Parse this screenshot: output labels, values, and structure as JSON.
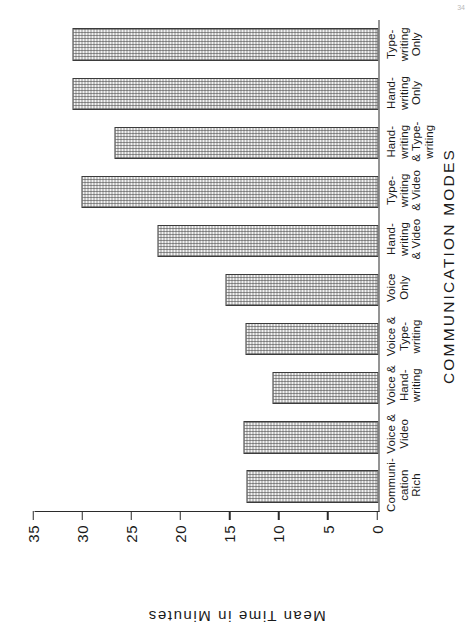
{
  "figure": {
    "corner_mark": "34",
    "orientation": "landscape-rotated"
  },
  "chart_data": {
    "type": "bar",
    "orientation": "vertical",
    "title": "",
    "xlabel": "COMMUNICATION MODES",
    "ylabel": "Mean Time in Minutes",
    "ylim": [
      0,
      35
    ],
    "yticks": [
      0,
      5,
      10,
      15,
      20,
      25,
      30,
      35
    ],
    "ytick_labels": [
      "0",
      "5",
      "10",
      "15",
      "20",
      "25",
      "30",
      "35"
    ],
    "grid": false,
    "legend": null,
    "categories": [
      "Communi-\ncation\nRich",
      "Voice &\nVideo",
      "Voice &\nHand-\nwriting",
      "Voice &\nType-\nwriting",
      "Voice\nOnly",
      "Hand-\nwriting\n& Video",
      "Type-\nwriting\n& Video",
      "Hand-\nwriting\n& Type-\nwriting",
      "Hand-\nwriting\nOnly",
      "Type-\nwriting\nOnly"
    ],
    "category_lines": [
      [
        "Communi-",
        "cation",
        "Rich"
      ],
      [
        "Voice &",
        "Video"
      ],
      [
        "Voice &",
        "Hand-",
        "writing"
      ],
      [
        "Voice &",
        "Type-",
        "writing"
      ],
      [
        "Voice",
        "Only"
      ],
      [
        "Hand-",
        "writing",
        "& Video"
      ],
      [
        "Type-",
        "writing",
        "& Video"
      ],
      [
        "Hand-",
        "writing",
        "& Type-",
        "writing"
      ],
      [
        "Hand-",
        "writing",
        "Only"
      ],
      [
        "Type-",
        "writing",
        "Only"
      ]
    ],
    "values": [
      13.4,
      13.7,
      10.8,
      13.5,
      15.6,
      22.5,
      30.2,
      26.9,
      31.1,
      31.1
    ],
    "bar_fill": "#f2f2f2",
    "bar_edge": "#3b3b3b",
    "axis_color": "#2b2b2b"
  }
}
